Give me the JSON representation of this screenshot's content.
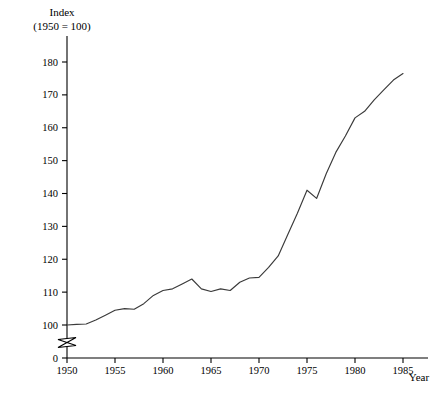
{
  "chart_data": {
    "type": "line",
    "title": "",
    "ylabel_line1": "Index",
    "ylabel_line2": "(1950 = 100)",
    "xlabel": "Year",
    "xlim": [
      1950,
      1985
    ],
    "ylim": [
      100,
      180
    ],
    "y_axis_break": true,
    "y_break_label": "0",
    "grid": false,
    "legend": null,
    "xticks": [
      1950,
      1955,
      1960,
      1965,
      1970,
      1975,
      1980,
      1985
    ],
    "xtick_labels": [
      "1950",
      "1955",
      "1960",
      "1965",
      "1970",
      "1975",
      "1980",
      "1985"
    ],
    "yticks": [
      0,
      100,
      110,
      120,
      130,
      140,
      150,
      160,
      170,
      180
    ],
    "ytick_labels": [
      "0",
      "100",
      "110",
      "120",
      "130",
      "140",
      "150",
      "160",
      "170",
      "180"
    ],
    "line_color": "#3a3a3a",
    "x": [
      1950,
      1951,
      1952,
      1953,
      1954,
      1955,
      1956,
      1957,
      1958,
      1959,
      1960,
      1961,
      1962,
      1963,
      1964,
      1965,
      1966,
      1967,
      1968,
      1969,
      1970,
      1971,
      1972,
      1973,
      1974,
      1975,
      1976,
      1977,
      1978,
      1979,
      1980,
      1981,
      1982,
      1983,
      1984,
      1985
    ],
    "values": [
      100.0,
      100.2,
      100.3,
      101.5,
      103.0,
      104.5,
      105.0,
      104.8,
      106.5,
      109.0,
      110.5,
      111.0,
      112.5,
      114.0,
      111.0,
      110.2,
      111.0,
      110.5,
      113.0,
      114.3,
      114.5,
      117.5,
      121.0,
      127.5,
      134.0,
      141.0,
      138.5,
      146.0,
      152.5,
      157.5,
      163.0,
      165.0,
      168.5,
      171.5,
      174.5,
      176.5
    ],
    "series": [
      {
        "name": "Index",
        "values": [
          100.0,
          100.2,
          100.3,
          101.5,
          103.0,
          104.5,
          105.0,
          104.8,
          106.5,
          109.0,
          110.5,
          111.0,
          112.5,
          114.0,
          111.0,
          110.2,
          111.0,
          110.5,
          113.0,
          114.3,
          114.5,
          117.5,
          121.0,
          127.5,
          134.0,
          141.0,
          138.5,
          146.0,
          152.5,
          157.5,
          163.0,
          165.0,
          168.5,
          171.5,
          174.5,
          176.5
        ]
      }
    ]
  }
}
